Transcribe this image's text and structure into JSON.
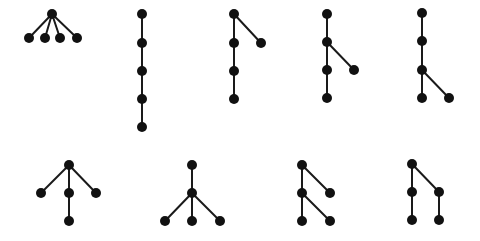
{
  "diagram": {
    "style": {
      "node_color": "#111111",
      "edge_color": "#1a1a1a",
      "node_radius": 5,
      "edge_width": 2,
      "background": "#ffffff"
    },
    "trees": [
      {
        "id": "tree-1",
        "shape": "star-root-4-children",
        "nodes": [
          [
            52,
            14
          ],
          [
            29,
            38
          ],
          [
            45,
            38
          ],
          [
            60,
            38
          ],
          [
            77,
            38
          ]
        ],
        "edges": [
          [
            0,
            1
          ],
          [
            0,
            2
          ],
          [
            0,
            3
          ],
          [
            0,
            4
          ]
        ]
      },
      {
        "id": "tree-2",
        "shape": "path-5",
        "nodes": [
          [
            142,
            14
          ],
          [
            142,
            43
          ],
          [
            142,
            71
          ],
          [
            142,
            99
          ],
          [
            142,
            127
          ]
        ],
        "edges": [
          [
            0,
            1
          ],
          [
            1,
            2
          ],
          [
            2,
            3
          ],
          [
            3,
            4
          ]
        ]
      },
      {
        "id": "tree-3",
        "shape": "path-4-with-leaf-on-root",
        "nodes": [
          [
            234,
            14
          ],
          [
            234,
            43
          ],
          [
            234,
            71
          ],
          [
            234,
            99
          ],
          [
            261,
            43
          ]
        ],
        "edges": [
          [
            0,
            1
          ],
          [
            1,
            2
          ],
          [
            2,
            3
          ],
          [
            0,
            4
          ]
        ]
      },
      {
        "id": "tree-4",
        "shape": "path-4-with-leaf-on-second",
        "nodes": [
          [
            327,
            14
          ],
          [
            327,
            42
          ],
          [
            327,
            70
          ],
          [
            327,
            98
          ],
          [
            354,
            70
          ]
        ],
        "edges": [
          [
            0,
            1
          ],
          [
            1,
            2
          ],
          [
            2,
            3
          ],
          [
            1,
            4
          ]
        ]
      },
      {
        "id": "tree-5",
        "shape": "path-4-with-leaf-on-third",
        "nodes": [
          [
            422,
            13
          ],
          [
            422,
            41
          ],
          [
            422,
            70
          ],
          [
            422,
            98
          ],
          [
            449,
            98
          ]
        ],
        "edges": [
          [
            0,
            1
          ],
          [
            1,
            2
          ],
          [
            2,
            3
          ],
          [
            2,
            4
          ]
        ]
      },
      {
        "id": "tree-6",
        "shape": "root-3-children-middle-extended",
        "nodes": [
          [
            69,
            165
          ],
          [
            41,
            193
          ],
          [
            69,
            193
          ],
          [
            96,
            193
          ],
          [
            69,
            221
          ]
        ],
        "edges": [
          [
            0,
            1
          ],
          [
            0,
            2
          ],
          [
            0,
            3
          ],
          [
            2,
            4
          ]
        ]
      },
      {
        "id": "tree-7",
        "shape": "root-single-child-with-3-leaves",
        "nodes": [
          [
            192,
            165
          ],
          [
            192,
            193
          ],
          [
            165,
            221
          ],
          [
            192,
            221
          ],
          [
            220,
            221
          ]
        ],
        "edges": [
          [
            0,
            1
          ],
          [
            1,
            2
          ],
          [
            1,
            3
          ],
          [
            1,
            4
          ]
        ]
      },
      {
        "id": "tree-8",
        "shape": "root-2-children-left-has-2-leaves",
        "nodes": [
          [
            302,
            165
          ],
          [
            302,
            193
          ],
          [
            330,
            193
          ],
          [
            302,
            221
          ],
          [
            330,
            221
          ]
        ],
        "edges": [
          [
            0,
            1
          ],
          [
            0,
            2
          ],
          [
            1,
            3
          ],
          [
            1,
            4
          ]
        ]
      },
      {
        "id": "tree-9",
        "shape": "root-2-children-each-with-1-leaf",
        "nodes": [
          [
            412,
            164
          ],
          [
            412,
            192
          ],
          [
            439,
            192
          ],
          [
            412,
            220
          ],
          [
            439,
            220
          ]
        ],
        "edges": [
          [
            0,
            1
          ],
          [
            0,
            2
          ],
          [
            1,
            3
          ],
          [
            2,
            4
          ]
        ]
      }
    ]
  }
}
